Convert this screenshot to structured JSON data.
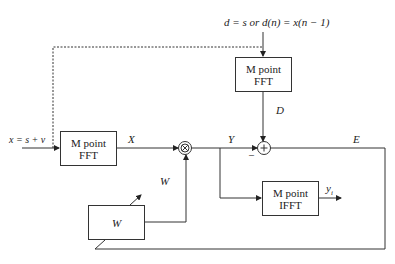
{
  "diagram": {
    "desired_input_label": "d = s or d(n) = x(n − 1)",
    "input_label": "x = s + v",
    "blocks": {
      "fft_input": {
        "line1": "M point",
        "line2": "FFT"
      },
      "fft_desired": {
        "line1": "M point",
        "line2": "FFT"
      },
      "ifft_output": {
        "line1": "M point",
        "line2": "IFFT"
      },
      "weights": {
        "label": "W"
      }
    },
    "signals": {
      "X": "X",
      "Y": "Y",
      "D": "D",
      "E": "E",
      "W": "W",
      "y": "y",
      "y_sub": "i",
      "minus": "–"
    },
    "operators": {
      "multiplier": "⊗",
      "summer": "+"
    }
  }
}
